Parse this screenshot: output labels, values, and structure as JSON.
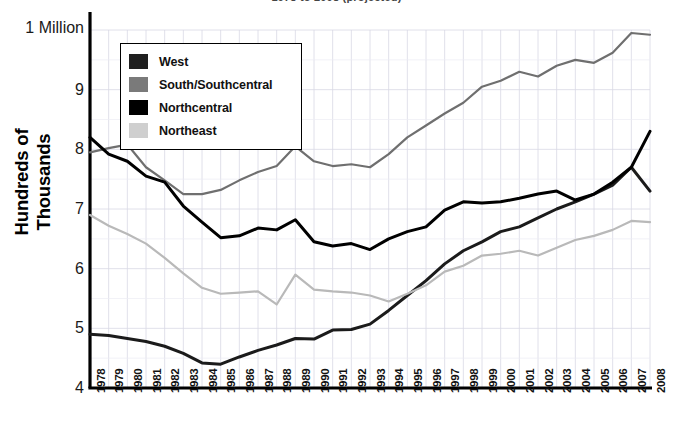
{
  "chart_data": {
    "type": "line",
    "title": "1978 to 2008 (projected)",
    "xlabel": "",
    "ylabel": "Hundreds of Thousands",
    "y_top_label": "1 Million",
    "ylim": [
      4,
      10
    ],
    "yticks": [
      4,
      5,
      6,
      7,
      8,
      9
    ],
    "ytick_labels": [
      "4",
      "5",
      "6",
      "7",
      "8",
      "9"
    ],
    "grid": true,
    "legend_position": "upper-left",
    "categories": [
      "1978",
      "1979",
      "1980",
      "1981",
      "1982",
      "1983",
      "1984",
      "1985",
      "1986",
      "1987",
      "1988",
      "1989",
      "1990",
      "1991",
      "1992",
      "1993",
      "1994",
      "1995",
      "1996",
      "1997",
      "1998",
      "1999",
      "2000",
      "2001",
      "2002",
      "2003",
      "2004",
      "2005",
      "2006",
      "2007",
      "2008"
    ],
    "series": [
      {
        "name": "West",
        "color": "#1b1b1b",
        "values": [
          4.9,
          4.88,
          4.83,
          4.78,
          4.7,
          4.58,
          4.42,
          4.4,
          4.52,
          4.63,
          4.72,
          4.83,
          4.82,
          4.97,
          4.98,
          5.07,
          5.3,
          5.55,
          5.8,
          6.08,
          6.3,
          6.45,
          6.62,
          6.7,
          6.85,
          7.0,
          7.12,
          7.25,
          7.4,
          7.7,
          7.3
        ]
      },
      {
        "name": "South/Southcentral",
        "color": "#6f6f6f",
        "values": [
          7.95,
          8.02,
          8.08,
          7.7,
          7.48,
          7.25,
          7.25,
          7.32,
          7.48,
          7.62,
          7.72,
          8.05,
          7.8,
          7.72,
          7.75,
          7.7,
          7.92,
          8.2,
          8.4,
          8.6,
          8.78,
          9.05,
          9.15,
          9.3,
          9.22,
          9.4,
          9.5,
          9.45,
          9.62,
          9.95,
          9.92
        ]
      },
      {
        "name": "Northcentral",
        "color": "#000000",
        "values": [
          8.2,
          7.92,
          7.8,
          7.55,
          7.45,
          7.05,
          6.78,
          6.52,
          6.55,
          6.68,
          6.65,
          6.82,
          6.45,
          6.38,
          6.42,
          6.32,
          6.5,
          6.62,
          6.7,
          6.98,
          7.12,
          7.1,
          7.12,
          7.18,
          7.25,
          7.3,
          7.15,
          7.25,
          7.45,
          7.7,
          8.3
        ]
      },
      {
        "name": "Northeast",
        "color": "#b9b9b9",
        "values": [
          6.9,
          6.72,
          6.58,
          6.42,
          6.18,
          5.92,
          5.68,
          5.58,
          5.6,
          5.62,
          5.4,
          5.9,
          5.65,
          5.62,
          5.6,
          5.55,
          5.45,
          5.58,
          5.72,
          5.95,
          6.05,
          6.22,
          6.25,
          6.3,
          6.22,
          6.35,
          6.48,
          6.55,
          6.65,
          6.8,
          6.78
        ]
      }
    ]
  },
  "legend": {
    "items": [
      {
        "label": "West",
        "color": "#1f1f1f"
      },
      {
        "label": "South/Southcentral",
        "color": "#7a7a7a"
      },
      {
        "label": "Northcentral",
        "color": "#000000"
      },
      {
        "label": "Northeast",
        "color": "#cfcfcf"
      }
    ]
  }
}
